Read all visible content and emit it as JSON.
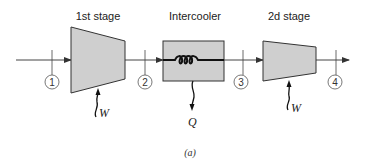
{
  "diagram": {
    "caption": "(a)",
    "colors": {
      "component_fill": "#cfcfcf",
      "stroke": "#333333",
      "line": "#444444"
    },
    "components": [
      {
        "id": "stage1",
        "type": "compressor",
        "label": "1st stage",
        "work_symbol": "W"
      },
      {
        "id": "intercooler",
        "type": "heat-exchanger",
        "label": "Intercooler",
        "heat_symbol": "Q"
      },
      {
        "id": "stage2",
        "type": "compressor",
        "label": "2d stage",
        "work_symbol": "W"
      }
    ],
    "states": [
      {
        "id": "s1",
        "label": "1"
      },
      {
        "id": "s2",
        "label": "2"
      },
      {
        "id": "s3",
        "label": "3"
      },
      {
        "id": "s4",
        "label": "4"
      }
    ],
    "flow": [
      "1 → 1st stage → 2",
      "2 → Intercooler → 3",
      "3 → 2d stage → 4"
    ]
  }
}
